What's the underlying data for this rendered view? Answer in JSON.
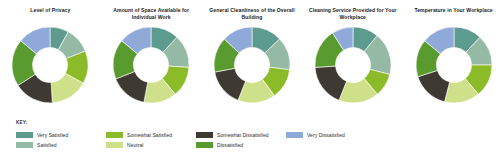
{
  "key": {
    "label": "KEY:"
  },
  "legend": [
    {
      "label": "Very Satisfied",
      "color": "#5d9b8e"
    },
    {
      "label": "Satisfied",
      "color": "#94b9a4"
    },
    {
      "label": "Somewhat Satisfied",
      "color": "#8cbb2a"
    },
    {
      "label": "Neutral",
      "color": "#cfe08a"
    },
    {
      "label": "Somewhat Dissatisfied",
      "color": "#3e3a33"
    },
    {
      "label": "Dissatisfied",
      "color": "#5a9b2f"
    },
    {
      "label": "Very Dissatisfied",
      "color": "#8fa9d8"
    }
  ],
  "chart_data": [
    {
      "type": "pie",
      "title": "Level of Privacy",
      "categories": [
        "Very Satisfied",
        "Satisfied",
        "Somewhat Satisfied",
        "Neutral",
        "Somewhat Dissatisfied",
        "Dissatisfied",
        "Very Dissatisfied"
      ],
      "values": [
        8,
        11,
        14,
        16,
        17,
        20,
        14
      ],
      "colors": [
        "#5d9b8e",
        "#94b9a4",
        "#8cbb2a",
        "#cfe08a",
        "#3e3a33",
        "#5a9b2f",
        "#8fa9d8"
      ],
      "legend_position": "bottom",
      "grid": false
    },
    {
      "type": "pie",
      "title": "Amount of Space Available for Individual Work",
      "categories": [
        "Very Satisfied",
        "Satisfied",
        "Somewhat Satisfied",
        "Neutral",
        "Somewhat Dissatisfied",
        "Dissatisfied",
        "Very Dissatisfied"
      ],
      "values": [
        12,
        14,
        13,
        14,
        16,
        17,
        14
      ],
      "colors": [
        "#5d9b8e",
        "#94b9a4",
        "#8cbb2a",
        "#cfe08a",
        "#3e3a33",
        "#5a9b2f",
        "#8fa9d8"
      ],
      "legend_position": "bottom",
      "grid": false
    },
    {
      "type": "pie",
      "title": "General Cleanliness of the Overall Building",
      "categories": [
        "Very Satisfied",
        "Satisfied",
        "Somewhat Satisfied",
        "Neutral",
        "Somewhat Dissatisfied",
        "Dissatisfied",
        "Very Dissatisfied"
      ],
      "values": [
        13,
        14,
        13,
        16,
        16,
        15,
        13
      ],
      "colors": [
        "#5d9b8e",
        "#94b9a4",
        "#8cbb2a",
        "#cfe08a",
        "#3e3a33",
        "#5a9b2f",
        "#8fa9d8"
      ],
      "legend_position": "bottom",
      "grid": false
    },
    {
      "type": "pie",
      "title": "Cleaning Service Provided for Your Workplace",
      "categories": [
        "Very Satisfied",
        "Satisfied",
        "Somewhat Satisfied",
        "Neutral",
        "Somewhat Dissatisfied",
        "Dissatisfied",
        "Very Dissatisfied"
      ],
      "values": [
        11,
        18,
        10,
        17,
        18,
        17,
        9
      ],
      "colors": [
        "#5d9b8e",
        "#94b9a4",
        "#8cbb2a",
        "#cfe08a",
        "#3e3a33",
        "#5a9b2f",
        "#8fa9d8"
      ],
      "legend_position": "bottom",
      "grid": false
    },
    {
      "type": "pie",
      "title": "Temperature in Your Workplace",
      "categories": [
        "Very Satisfied",
        "Satisfied",
        "Somewhat Satisfied",
        "Neutral",
        "Somewhat Dissatisfied",
        "Dissatisfied",
        "Very Dissatisfied"
      ],
      "values": [
        12,
        13,
        14,
        15,
        16,
        16,
        14
      ],
      "colors": [
        "#5d9b8e",
        "#94b9a4",
        "#8cbb2a",
        "#cfe08a",
        "#3e3a33",
        "#5a9b2f",
        "#8fa9d8"
      ],
      "legend_position": "bottom",
      "grid": false
    }
  ]
}
